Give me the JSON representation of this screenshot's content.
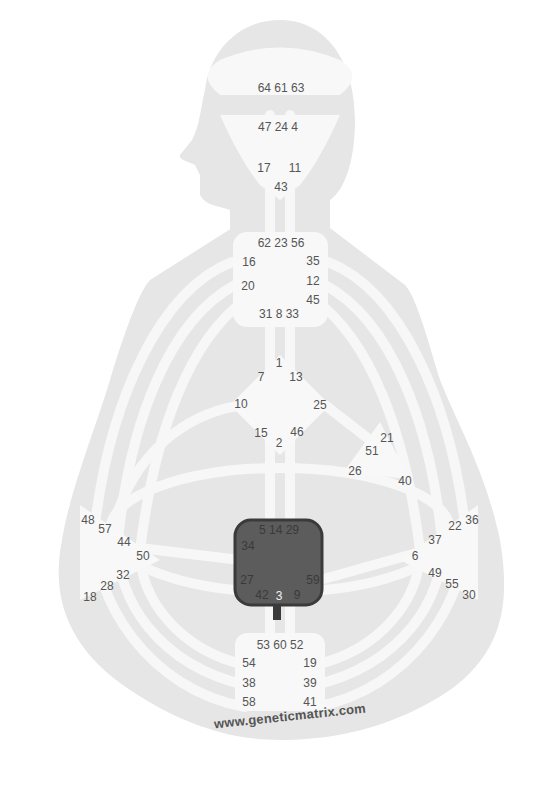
{
  "diagram": {
    "type": "human-design-bodygraph",
    "watermark": "www.geneticmatrix.com",
    "colors": {
      "background": "#ffffff",
      "silhouette": "#e6e6e6",
      "channel": "#f6f6f6",
      "center_undefined": "#f8f8f8",
      "center_defined": "#5c5c5c",
      "text": "#555555"
    },
    "centers": [
      {
        "name": "Head",
        "defined": false,
        "gates": [
          "64",
          "61",
          "63"
        ]
      },
      {
        "name": "Ajna",
        "defined": false,
        "gates": [
          "47",
          "24",
          "4",
          "17",
          "11",
          "43"
        ]
      },
      {
        "name": "Throat",
        "defined": false,
        "gates": [
          "62",
          "23",
          "56",
          "16",
          "35",
          "20",
          "12",
          "45",
          "31",
          "8",
          "33"
        ]
      },
      {
        "name": "G Center",
        "defined": false,
        "gates": [
          "1",
          "7",
          "13",
          "10",
          "25",
          "15",
          "46",
          "2"
        ]
      },
      {
        "name": "Heart / Ego",
        "defined": false,
        "gates": [
          "21",
          "51",
          "26",
          "40"
        ]
      },
      {
        "name": "Spleen",
        "defined": false,
        "gates": [
          "48",
          "57",
          "44",
          "50",
          "32",
          "28",
          "18"
        ]
      },
      {
        "name": "Solar Plexus",
        "defined": false,
        "gates": [
          "36",
          "22",
          "37",
          "6",
          "49",
          "55",
          "30"
        ]
      },
      {
        "name": "Sacral",
        "defined": true,
        "gates": [
          "5",
          "14",
          "29",
          "34",
          "27",
          "59",
          "42",
          "3",
          "9"
        ]
      },
      {
        "name": "Root",
        "defined": false,
        "gates": [
          "53",
          "60",
          "52",
          "54",
          "19",
          "38",
          "39",
          "58",
          "41"
        ]
      }
    ]
  },
  "labels": {
    "head_row": "64 61 63",
    "ajna_row": "47 24  4",
    "g17": "17",
    "g11": "11",
    "g43": "43",
    "throat_row": "62 23 56",
    "g16": "16",
    "g35": "35",
    "g20": "20",
    "g12": "12",
    "g45": "45",
    "throat_bottom": "31  8  33",
    "g1": "1",
    "g7": "7",
    "g13": "13",
    "g10": "10",
    "g25": "25",
    "g15": "15",
    "g46": "46",
    "g2": "2",
    "g21": "21",
    "g51": "51",
    "g26": "26",
    "g40": "40",
    "g48": "48",
    "g57": "57",
    "g44": "44",
    "g50": "50",
    "g32": "32",
    "g28": "28",
    "g18": "18",
    "g36": "36",
    "g22": "22",
    "g37": "37",
    "g6": "6",
    "g49": "49",
    "g55": "55",
    "g30": "30",
    "sacral_top": "5  14  29",
    "g34": "34",
    "g27": "27",
    "g59": "59",
    "g42": "42",
    "g3": "3",
    "g9": "9",
    "root_row": "53 60 52",
    "g54": "54",
    "g19": "19",
    "g38": "38",
    "g39": "39",
    "g58": "58",
    "g41": "41"
  }
}
